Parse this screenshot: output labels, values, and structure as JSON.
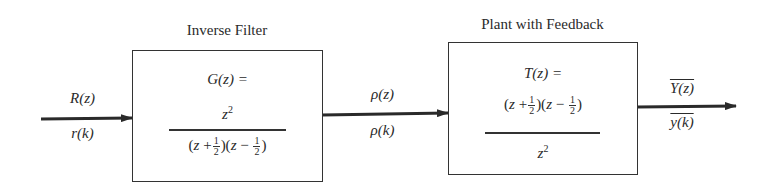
{
  "diagram": {
    "type": "block-diagram",
    "blocks": [
      {
        "id": "inverse-filter",
        "title": "Inverse Filter",
        "lhs": "G(z) =",
        "numerator": "z²",
        "denominator": "(z + ½)(z − ½)"
      },
      {
        "id": "plant-with-feedback",
        "title": "Plant with Feedback",
        "lhs": "T(z) =",
        "numerator": "(z + ½)(z − ½)",
        "denominator": "z²"
      }
    ],
    "signals": [
      {
        "id": "input",
        "top": "R(z)",
        "bottom": "r(k)",
        "from": "source",
        "to": "inverse-filter"
      },
      {
        "id": "intermediate",
        "top": "ρ(z)",
        "bottom": "ρ(k)",
        "from": "inverse-filter",
        "to": "plant-with-feedback"
      },
      {
        "id": "output",
        "top": "Y(z)",
        "bottom": "y(k)",
        "overbar": true,
        "from": "plant-with-feedback",
        "to": "sink"
      }
    ]
  }
}
